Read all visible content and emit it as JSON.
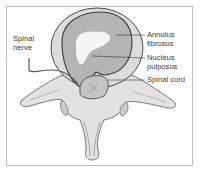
{
  "diagram": {
    "labels": {
      "spinal_nerve": "Spinal\nnerve",
      "annulus_fibrosus": "Annulus\nfibrosus",
      "nucleus_pulposus": "Nucleus\npulposus",
      "spinal_cord": "Spinal cord"
    },
    "colors": {
      "bone": "#e2e2e2",
      "bone_shade": "#c9c9c9",
      "annulus": "#b4b4b4",
      "nucleus": "#f4f4f4",
      "outline": "#4a4a4a",
      "leader_line": "#3a3a3a",
      "frame": "#bdbdbd"
    }
  }
}
